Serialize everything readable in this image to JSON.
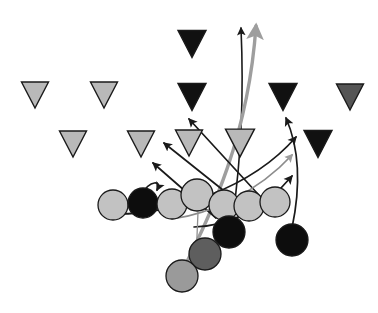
{
  "diagram": {
    "canvas": {
      "width": 378,
      "height": 313,
      "background": "#ffffff"
    },
    "palette": {
      "defense_light": "#b9b9b9",
      "defense_mid": "#555555",
      "defense_dark": "#111111",
      "offense_light": "#c2c2c2",
      "offense_mid": "#9a9a9a",
      "offense_dark_gray": "#5e5e5e",
      "offense_black": "#0d0d0d",
      "outline": "#1a1a1a",
      "route_black": "#1a1a1a",
      "route_gray": "#9e9e9e"
    },
    "defenders": [
      {
        "id": "d1",
        "label": "defender-1",
        "x": 35,
        "y": 95,
        "size": 27,
        "fill": "#b9b9b9",
        "shape": "triangle-down"
      },
      {
        "id": "d2",
        "label": "defender-2",
        "x": 104,
        "y": 95,
        "size": 27,
        "fill": "#b9b9b9",
        "shape": "triangle-down"
      },
      {
        "id": "d3",
        "label": "defender-3",
        "x": 192,
        "y": 44,
        "size": 28,
        "fill": "#111111",
        "shape": "triangle-down"
      },
      {
        "id": "d4",
        "label": "defender-4",
        "x": 192,
        "y": 97,
        "size": 28,
        "fill": "#111111",
        "shape": "triangle-down"
      },
      {
        "id": "d5",
        "label": "defender-5",
        "x": 283,
        "y": 97,
        "size": 28,
        "fill": "#111111",
        "shape": "triangle-down"
      },
      {
        "id": "d6",
        "label": "defender-6",
        "x": 350,
        "y": 97,
        "size": 27,
        "fill": "#555555",
        "shape": "triangle-down"
      },
      {
        "id": "d7",
        "label": "defender-7",
        "x": 73,
        "y": 144,
        "size": 27,
        "fill": "#b9b9b9",
        "shape": "triangle-down"
      },
      {
        "id": "d8",
        "label": "defender-8",
        "x": 141,
        "y": 144,
        "size": 27,
        "fill": "#b9b9b9",
        "shape": "triangle-down"
      },
      {
        "id": "d9",
        "label": "defender-9",
        "x": 189,
        "y": 143,
        "size": 27,
        "fill": "#b9b9b9",
        "shape": "triangle-down"
      },
      {
        "id": "d10",
        "label": "defender-10",
        "x": 240,
        "y": 143,
        "size": 29,
        "fill": "#b9b9b9",
        "shape": "triangle-down"
      },
      {
        "id": "d11",
        "label": "defender-11",
        "x": 318,
        "y": 144,
        "size": 28,
        "fill": "#111111",
        "shape": "triangle-down"
      }
    ],
    "offense": [
      {
        "id": "o1",
        "label": "lineman-left",
        "cx": 113,
        "cy": 205,
        "r": 15,
        "fill": "#c2c2c2"
      },
      {
        "id": "o2",
        "label": "receiver-black-left",
        "cx": 143,
        "cy": 203,
        "r": 15,
        "fill": "#0d0d0d"
      },
      {
        "id": "o3",
        "label": "lineman-2",
        "cx": 172,
        "cy": 204,
        "r": 15,
        "fill": "#c2c2c2"
      },
      {
        "id": "o4",
        "label": "lineman-center",
        "cx": 197,
        "cy": 195,
        "r": 16,
        "fill": "#c2c2c2"
      },
      {
        "id": "o5",
        "label": "lineman-3",
        "cx": 224,
        "cy": 205,
        "r": 15,
        "fill": "#c2c2c2"
      },
      {
        "id": "o6",
        "label": "lineman-4",
        "cx": 249,
        "cy": 206,
        "r": 15,
        "fill": "#c2c2c2"
      },
      {
        "id": "o7",
        "label": "lineman-right",
        "cx": 275,
        "cy": 202,
        "r": 15,
        "fill": "#c2c2c2"
      },
      {
        "id": "o8",
        "label": "back-black-mid",
        "cx": 229,
        "cy": 232,
        "r": 16,
        "fill": "#0d0d0d"
      },
      {
        "id": "o9",
        "label": "back-darkgray",
        "cx": 205,
        "cy": 254,
        "r": 16,
        "fill": "#5e5e5e"
      },
      {
        "id": "o10",
        "label": "back-gray-deep",
        "cx": 182,
        "cy": 276,
        "r": 16,
        "fill": "#9a9a9a"
      },
      {
        "id": "o11",
        "label": "back-black-right",
        "cx": 292,
        "cy": 240,
        "r": 16,
        "fill": "#0d0d0d"
      }
    ],
    "routes": [
      {
        "id": "r1",
        "label": "route-vertical-black",
        "color": "#1a1a1a",
        "width": 1.6,
        "arrow": "black",
        "path": "M 233 215 C 238 180, 245 120, 241 28"
      },
      {
        "id": "r2",
        "label": "route-vertical-gray",
        "color": "#9e9e9e",
        "width": 3.4,
        "arrow": "gray",
        "path": "M 182 272 C 210 215, 248 140, 256 26"
      },
      {
        "id": "r3",
        "label": "route-out-left-upper",
        "color": "#1a1a1a",
        "width": 1.7,
        "arrow": "black",
        "path": "M 268 205 L 189 119"
      },
      {
        "id": "r4",
        "label": "route-out-left-mid",
        "color": "#1a1a1a",
        "width": 1.7,
        "arrow": "black",
        "path": "M 248 210 L 164 143"
      },
      {
        "id": "r5",
        "label": "route-out-left-low",
        "color": "#1a1a1a",
        "width": 1.7,
        "arrow": "black",
        "path": "M 216 218 L 153 163"
      },
      {
        "id": "r6",
        "label": "route-drag-right-top",
        "color": "#1a1a1a",
        "width": 1.7,
        "arrow": "black",
        "path": "M 117 214 C 170 214, 250 190, 296 137"
      },
      {
        "id": "r7",
        "label": "route-drag-right-mid",
        "color": "#8c8c8c",
        "width": 1.7,
        "arrow": "gray",
        "path": "M 172 219 C 210 214, 258 192, 292 155"
      },
      {
        "id": "r8",
        "label": "route-drag-right-low",
        "color": "#1a1a1a",
        "width": 1.7,
        "arrow": "black",
        "path": "M 194 227 C 226 226, 262 212, 292 176"
      },
      {
        "id": "r9",
        "label": "route-curl-right-deep",
        "color": "#1a1a1a",
        "width": 1.7,
        "arrow": "black",
        "path": "M 292 228 C 300 190, 300 150, 286 118"
      },
      {
        "id": "r10",
        "label": "route-hook-short",
        "color": "#1a1a1a",
        "width": 1.7,
        "arrow": "black",
        "path": "M 142 194 C 150 180, 162 180, 157 190"
      },
      {
        "id": "r11",
        "label": "route-stem-dashed",
        "color": "#8f8f8f",
        "width": 1.3,
        "arrow": "none",
        "path": "M 198 212 L 196 260"
      }
    ]
  }
}
